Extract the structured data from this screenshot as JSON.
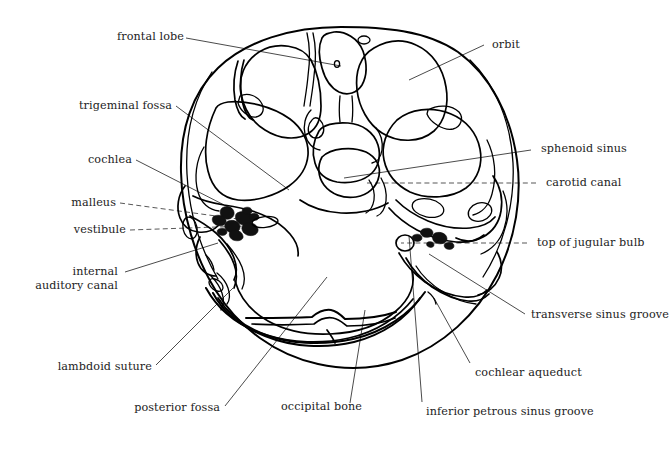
{
  "figure": {
    "background_color": "#ffffff",
    "line_color": "#000000",
    "label_color": "#1c1c1c",
    "leader_color": "#2b2b2b",
    "width": 672,
    "height": 467
  },
  "labels": {
    "frontal_lobe": "frontal lobe",
    "trigeminal_fossa": "trigeminal fossa",
    "cochlea": "cochlea",
    "malleus": "malleus",
    "vestibule": "vestibule",
    "internal_auditory_canal_line1": "internal",
    "internal_auditory_canal_line2": "auditory canal",
    "lambdoid_suture": "lambdoid suture",
    "posterior_fossa": "posterior fossa",
    "occipital_bone": "occipital bone",
    "inferior_petrous_sinus_groove": "inferior petrous sinus groove",
    "cochlear_aqueduct": "cochlear aqueduct",
    "transverse_sinus_groove": "transverse sinus groove",
    "top_of_jugular_bulb": "top of jugular bulb",
    "carotid_canal": "carotid canal",
    "sphenoid_sinus": "sphenoid sinus",
    "orbit": "orbit"
  },
  "annotations": [
    {
      "id": "frontal-lobe",
      "text": "frontal lobe",
      "side": "left",
      "leader_style": "solid"
    },
    {
      "id": "trigeminal-fossa",
      "text": "trigeminal fossa",
      "side": "left",
      "leader_style": "solid"
    },
    {
      "id": "cochlea",
      "text": "cochlea",
      "side": "left",
      "leader_style": "solid"
    },
    {
      "id": "malleus",
      "text": "malleus",
      "side": "left",
      "leader_style": "dashed"
    },
    {
      "id": "vestibule",
      "text": "vestibule",
      "side": "left",
      "leader_style": "dashed"
    },
    {
      "id": "internal-auditory-canal",
      "text": "internal auditory canal",
      "side": "left",
      "leader_style": "solid"
    },
    {
      "id": "lambdoid-suture",
      "text": "lambdoid suture",
      "side": "left",
      "leader_style": "solid"
    },
    {
      "id": "posterior-fossa",
      "text": "posterior fossa",
      "side": "left",
      "leader_style": "solid"
    },
    {
      "id": "occipital-bone",
      "text": "occipital bone",
      "side": "bottom",
      "leader_style": "solid"
    },
    {
      "id": "inferior-petrous-sinus-groove",
      "text": "inferior petrous sinus groove",
      "side": "bottom",
      "leader_style": "solid"
    },
    {
      "id": "cochlear-aqueduct",
      "text": "cochlear aqueduct",
      "side": "bottom",
      "leader_style": "solid"
    },
    {
      "id": "transverse-sinus-groove",
      "text": "transverse sinus groove",
      "side": "right",
      "leader_style": "solid"
    },
    {
      "id": "top-of-jugular-bulb",
      "text": "top of jugular bulb",
      "side": "right",
      "leader_style": "dashed"
    },
    {
      "id": "carotid-canal",
      "text": "carotid canal",
      "side": "right",
      "leader_style": "dashed"
    },
    {
      "id": "sphenoid-sinus",
      "text": "sphenoid sinus",
      "side": "right",
      "leader_style": "solid"
    },
    {
      "id": "orbit",
      "text": "orbit",
      "side": "right",
      "leader_style": "solid"
    }
  ]
}
